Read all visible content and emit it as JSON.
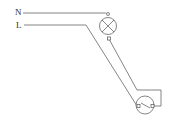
{
  "diagram": {
    "type": "circuit-schematic",
    "labels": {
      "neutral": "N",
      "live": "L"
    },
    "components": [
      {
        "id": "lamp",
        "kind": "lamp",
        "symbol": "circle-with-cross"
      },
      {
        "id": "switch",
        "kind": "single-pole-switch",
        "symbol": "circle-with-lever"
      }
    ],
    "wires": [
      {
        "from": "N",
        "to": "lamp.top"
      },
      {
        "from": "L",
        "to": "switch.left"
      },
      {
        "from": "lamp.bottom",
        "to": "switch.right"
      }
    ],
    "colors": {
      "line": "#666666",
      "text": "#333333",
      "background": "#ffffff"
    }
  }
}
